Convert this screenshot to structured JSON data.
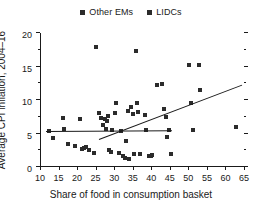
{
  "chart_data": {
    "type": "scatter",
    "title": "",
    "xlabel": "Share of food in consumption basket",
    "ylabel": "Average CPI inflation, 2004–16",
    "xlim": [
      10,
      65
    ],
    "ylim": [
      0,
      20
    ],
    "xticks": [
      10,
      15,
      20,
      25,
      30,
      35,
      40,
      45,
      50,
      55,
      60,
      65
    ],
    "yticks": [
      0,
      5,
      10,
      15,
      20
    ],
    "y_minor_ticks": [
      2.5,
      7.5,
      12.5,
      17.5
    ],
    "grid": false,
    "legend_position": "top-center",
    "marker": "square",
    "marker_color": "#2b2b2b",
    "legend": [
      {
        "name": "Other EMs",
        "marker": "square",
        "color": "#2b2b2b"
      },
      {
        "name": "LIDCs",
        "marker": "square",
        "color": "#2b2b2b"
      }
    ],
    "series": [
      {
        "name": "Other EMs",
        "points": [
          [
            12.4,
            5.4
          ],
          [
            13.6,
            4.4
          ],
          [
            16.3,
            7.3
          ],
          [
            16.5,
            5.7
          ],
          [
            17.6,
            3.4
          ],
          [
            19.5,
            3.1
          ],
          [
            20.8,
            7.2
          ],
          [
            21.3,
            2.7
          ],
          [
            21.9,
            2.9
          ],
          [
            22.4,
            3.0
          ],
          [
            23.3,
            2.6
          ],
          [
            24.6,
            2.1
          ],
          [
            25.2,
            17.9
          ],
          [
            25.9,
            8.0
          ],
          [
            26.4,
            7.3
          ],
          [
            27.0,
            6.2
          ],
          [
            27.4,
            7.1
          ],
          [
            27.8,
            5.6
          ],
          [
            28.0,
            6.8
          ],
          [
            28.4,
            7.6
          ],
          [
            28.6,
            2.5
          ],
          [
            29.1,
            2.3
          ],
          [
            29.5,
            5.5
          ],
          [
            30.2,
            8.0
          ],
          [
            30.6,
            9.6
          ],
          [
            31.3,
            2.1
          ],
          [
            31.8,
            5.4
          ],
          [
            32.3,
            1.7
          ],
          [
            32.9,
            1.3
          ],
          [
            33.2,
            3.9
          ],
          [
            33.6,
            8.3
          ],
          [
            34.0,
            1.2
          ],
          [
            34.6,
            8.9
          ],
          [
            35.0,
            7.9
          ],
          [
            35.3,
            1.9
          ],
          [
            35.9,
            17.3
          ],
          [
            36.2,
            9.6
          ],
          [
            36.5,
            8.2
          ],
          [
            36.9,
            2.0
          ],
          [
            38.2,
            7.8
          ],
          [
            38.6,
            5.5
          ],
          [
            39.3,
            1.7
          ],
          [
            39.8,
            1.6
          ],
          [
            40.1,
            1.8
          ],
          [
            41.6,
            12.2
          ],
          [
            43.0,
            12.4
          ],
          [
            43.4,
            8.6
          ],
          [
            43.9,
            7.4
          ],
          [
            44.2,
            4.5
          ],
          [
            44.9,
            5.5
          ],
          [
            45.2,
            1.9
          ],
          [
            50.3,
            15.2
          ],
          [
            50.8,
            9.5
          ],
          [
            51.2,
            5.5
          ],
          [
            52.8,
            15.2
          ],
          [
            53.1,
            11.5
          ],
          [
            62.8,
            5.9
          ]
        ]
      }
    ],
    "trend_lines": [
      {
        "name": "Other EMs fit",
        "x0": 11.5,
        "y0": 5.4,
        "x1": 45.5,
        "y1": 5.5
      },
      {
        "name": "LIDCs fit",
        "x0": 26.0,
        "y0": 4.2,
        "x1": 64.5,
        "y1": 12.3
      }
    ]
  }
}
